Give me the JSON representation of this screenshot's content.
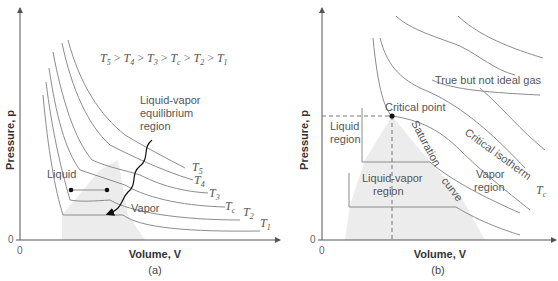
{
  "panel_a": {
    "caption": "(a)",
    "y_axis_label": "Pressure, p",
    "x_axis_label": "Volume, V",
    "y_origin": "0",
    "x_origin": "0",
    "ordering": {
      "parts": [
        "T",
        "5",
        " > ",
        "T",
        "4",
        " > ",
        "T",
        "3",
        " > ",
        "T",
        "c",
        " > ",
        "T",
        "2",
        " > ",
        "T",
        "1"
      ]
    },
    "labels": {
      "region_line1": "Liquid-vapor",
      "region_line2": "equilibrium",
      "region_line3": "region",
      "liquid": "Liquid",
      "vapor": "Vapor"
    },
    "isotherms": [
      {
        "base": "T",
        "sub": "5"
      },
      {
        "base": "T",
        "sub": "4"
      },
      {
        "base": "T",
        "sub": "3"
      },
      {
        "base": "T",
        "sub": "c"
      },
      {
        "base": "T",
        "sub": "2"
      },
      {
        "base": "T",
        "sub": "1"
      }
    ]
  },
  "panel_b": {
    "caption": "(b)",
    "y_axis_label": "Pressure, p",
    "x_axis_label": "Volume, V",
    "y_origin": "0",
    "x_origin": "0",
    "labels": {
      "true_gas": "True but not ideal gas",
      "critical_point": "Critical point",
      "liquid_region_line1": "Liquid",
      "liquid_region_line2": "region",
      "liquid_vapor_line1": "Liquid-vapor",
      "liquid_vapor_line2": "region",
      "saturation": "Saturation",
      "curve": "curve",
      "critical_isotherm": "Critical isotherm",
      "vapor_line1": "Vapor",
      "vapor_line2": "region",
      "tc_base": "T",
      "tc_sub": "c"
    }
  },
  "colors": {
    "curve": "#8c8c8c",
    "axis": "#555555",
    "region_fill": "#ececec",
    "text": "#555555",
    "marker": "#111111"
  }
}
